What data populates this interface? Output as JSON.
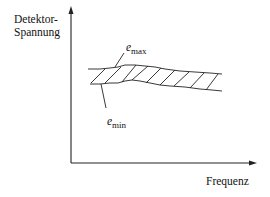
{
  "diagram": {
    "y_axis_label_line1": "Detektor-",
    "y_axis_label_line2": "Spannung",
    "x_axis_label": "Frequenz",
    "upper_curve_label": {
      "symbol": "e",
      "subscript": "max"
    },
    "lower_curve_label": {
      "symbol": "e",
      "subscript": "min"
    },
    "line_color": "#222222"
  }
}
